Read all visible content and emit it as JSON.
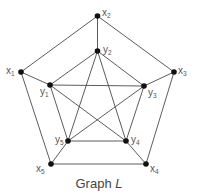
{
  "caption": {
    "text": "Graph",
    "name": "L"
  },
  "colors": {
    "edge": "#4a4a4a",
    "node": "#111111",
    "label": "#555555"
  },
  "nodes": [
    {
      "id": "x1",
      "base": "x",
      "sub": "1",
      "x": 21,
      "y": 72,
      "lx": 6,
      "ly": 66
    },
    {
      "id": "x2",
      "base": "x",
      "sub": "2",
      "x": 97.5,
      "y": 16,
      "lx": 102,
      "ly": 8
    },
    {
      "id": "x3",
      "base": "x",
      "sub": "3",
      "x": 174,
      "y": 72,
      "lx": 178,
      "ly": 66
    },
    {
      "id": "x4",
      "base": "x",
      "sub": "4",
      "x": 146,
      "y": 164,
      "lx": 150,
      "ly": 164
    },
    {
      "id": "x5",
      "base": "x",
      "sub": "5",
      "x": 51,
      "y": 164,
      "lx": 36,
      "ly": 164
    },
    {
      "id": "y1",
      "base": "y",
      "sub": "1",
      "x": 50,
      "y": 85,
      "lx": 40,
      "ly": 87
    },
    {
      "id": "y2",
      "base": "y",
      "sub": "2",
      "x": 97.5,
      "y": 51,
      "lx": 103,
      "ly": 45
    },
    {
      "id": "y3",
      "base": "y",
      "sub": "3",
      "x": 144,
      "y": 86,
      "lx": 148,
      "ly": 88
    },
    {
      "id": "y4",
      "base": "y",
      "sub": "4",
      "x": 126,
      "y": 141,
      "lx": 131,
      "ly": 135
    },
    {
      "id": "y5",
      "base": "y",
      "sub": "5",
      "x": 68,
      "y": 141,
      "lx": 55,
      "ly": 135
    }
  ],
  "edges": [
    [
      "x1",
      "x2"
    ],
    [
      "x2",
      "x3"
    ],
    [
      "x3",
      "x4"
    ],
    [
      "x4",
      "x5"
    ],
    [
      "x5",
      "x1"
    ],
    [
      "x1",
      "y1"
    ],
    [
      "x2",
      "y2"
    ],
    [
      "x3",
      "y3"
    ],
    [
      "x4",
      "y4"
    ],
    [
      "x5",
      "y5"
    ],
    [
      "y1",
      "y2"
    ],
    [
      "y2",
      "y3"
    ],
    [
      "y1",
      "y3"
    ],
    [
      "y1",
      "y5"
    ],
    [
      "y3",
      "y4"
    ],
    [
      "y5",
      "y4"
    ],
    [
      "y2",
      "y5"
    ],
    [
      "y2",
      "y4"
    ],
    [
      "y1",
      "y4"
    ],
    [
      "y3",
      "y5"
    ]
  ]
}
